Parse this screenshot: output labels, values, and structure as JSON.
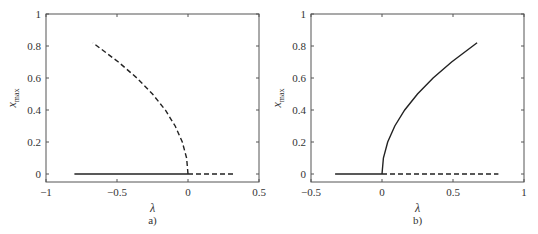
{
  "chart_data": [
    {
      "type": "line",
      "panel_label": "a)",
      "title": "",
      "xlabel": "λ",
      "ylabel": "x",
      "ylabel_sub": "max",
      "xlim": [
        -1,
        0.5
      ],
      "ylim": [
        -0.05,
        1
      ],
      "xticks": [
        -1,
        -0.5,
        0,
        0.5
      ],
      "xtick_labels": [
        "−1",
        "−0.5",
        "0",
        "0.5"
      ],
      "yticks": [
        0,
        0.2,
        0.4,
        0.6,
        0.8,
        1
      ],
      "ytick_labels": [
        "0",
        "0.2",
        "0.4",
        "0.6",
        "0.8",
        "1"
      ],
      "grid": false,
      "series": [
        {
          "name": "stable trivial branch",
          "style": "solid",
          "x": [
            -0.8,
            0
          ],
          "y": [
            0,
            0
          ]
        },
        {
          "name": "unstable trivial branch",
          "style": "dashed",
          "x": [
            0,
            0.33
          ],
          "y": [
            0,
            0
          ]
        },
        {
          "name": "unstable nontrivial branch",
          "style": "dashed",
          "x": [
            0,
            -0.01,
            -0.04,
            -0.09,
            -0.16,
            -0.25,
            -0.36,
            -0.49,
            -0.67
          ],
          "y": [
            0,
            0.1,
            0.2,
            0.3,
            0.4,
            0.5,
            0.6,
            0.7,
            0.82
          ]
        }
      ]
    },
    {
      "type": "line",
      "panel_label": "b)",
      "title": "",
      "xlabel": "λ",
      "ylabel": "x",
      "ylabel_sub": "max",
      "xlim": [
        -0.5,
        1
      ],
      "ylim": [
        -0.05,
        1
      ],
      "xticks": [
        -0.5,
        0,
        0.5,
        1
      ],
      "xtick_labels": [
        "−0.5",
        "0",
        "0.5",
        "1"
      ],
      "yticks": [
        0,
        0.2,
        0.4,
        0.6,
        0.8,
        1
      ],
      "ytick_labels": [
        "0",
        "0.2",
        "0.4",
        "0.6",
        "0.8",
        "1"
      ],
      "grid": false,
      "series": [
        {
          "name": "stable trivial branch",
          "style": "solid",
          "x": [
            -0.33,
            0
          ],
          "y": [
            0,
            0
          ]
        },
        {
          "name": "unstable trivial branch",
          "style": "dashed",
          "x": [
            0,
            0.82
          ],
          "y": [
            0,
            0
          ]
        },
        {
          "name": "stable nontrivial branch",
          "style": "solid",
          "x": [
            0,
            0.01,
            0.04,
            0.09,
            0.16,
            0.25,
            0.36,
            0.49,
            0.67
          ],
          "y": [
            0,
            0.1,
            0.2,
            0.3,
            0.4,
            0.5,
            0.6,
            0.7,
            0.82
          ]
        }
      ]
    }
  ]
}
